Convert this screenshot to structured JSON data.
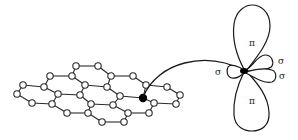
{
  "figure": {
    "colors": {
      "line": "#2a2a2a",
      "node_fill": "#ffffff",
      "active_node": "#000000",
      "background": "#ffffff"
    }
  },
  "lattice": {
    "nodes": [
      [
        76,
        66
      ],
      [
        98,
        66
      ],
      [
        50,
        76
      ],
      [
        72,
        76
      ],
      [
        111,
        76
      ],
      [
        133,
        76
      ],
      [
        23,
        85
      ],
      [
        44,
        87
      ],
      [
        85,
        85
      ],
      [
        107,
        87
      ],
      [
        146,
        85
      ],
      [
        167,
        87
      ],
      [
        17,
        94
      ],
      [
        58,
        94
      ],
      [
        80,
        95
      ],
      [
        120,
        96
      ],
      [
        143,
        98
      ],
      [
        180,
        95
      ],
      [
        32,
        103
      ],
      [
        52,
        104
      ],
      [
        91,
        104
      ],
      [
        113,
        105
      ],
      [
        154,
        103
      ],
      [
        176,
        104
      ],
      [
        67,
        113
      ],
      [
        88,
        113
      ],
      [
        128,
        113
      ],
      [
        149,
        113
      ],
      [
        102,
        122
      ],
      [
        124,
        122
      ]
    ],
    "active_node_index": 16,
    "edges": [
      [
        0,
        1
      ],
      [
        0,
        3
      ],
      [
        1,
        4
      ],
      [
        2,
        3
      ],
      [
        2,
        7
      ],
      [
        3,
        8
      ],
      [
        4,
        5
      ],
      [
        4,
        9
      ],
      [
        5,
        10
      ],
      [
        6,
        7
      ],
      [
        6,
        12
      ],
      [
        7,
        13
      ],
      [
        8,
        9
      ],
      [
        8,
        14
      ],
      [
        9,
        15
      ],
      [
        10,
        11
      ],
      [
        10,
        16
      ],
      [
        11,
        17
      ],
      [
        12,
        18
      ],
      [
        13,
        14
      ],
      [
        13,
        19
      ],
      [
        14,
        20
      ],
      [
        15,
        16
      ],
      [
        15,
        21
      ],
      [
        16,
        22
      ],
      [
        17,
        23
      ],
      [
        18,
        19
      ],
      [
        19,
        24
      ],
      [
        20,
        21
      ],
      [
        20,
        25
      ],
      [
        21,
        26
      ],
      [
        22,
        23
      ],
      [
        22,
        27
      ],
      [
        24,
        25
      ],
      [
        25,
        28
      ],
      [
        26,
        27
      ],
      [
        26,
        29
      ],
      [
        28,
        29
      ]
    ]
  },
  "orbital": {
    "center": [
      245,
      71
    ],
    "labels": {
      "pi_top": "π",
      "pi_bottom": "π",
      "sigma_left": "σ",
      "sigma_upper_right": "σ",
      "sigma_lower_right": "σ"
    }
  }
}
